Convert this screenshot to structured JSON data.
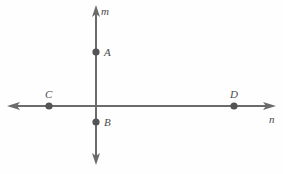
{
  "figure": {
    "background_color": "#fefefe",
    "line_color": "#6b6b6b",
    "point_color": "#545454",
    "label_color": "#4a4a4a",
    "lines": [
      {
        "name": "m",
        "label": "m",
        "orientation": "vertical",
        "label_x": 101,
        "label_y": 15,
        "x1": 96,
        "y1": 6,
        "x2": 96,
        "y2": 165,
        "arrow_start": true,
        "arrow_end": true
      },
      {
        "name": "n",
        "label": "n",
        "orientation": "horizontal",
        "label_x": 269,
        "label_y": 123,
        "x1": 8,
        "y1": 106,
        "x2": 275,
        "y2": 106,
        "arrow_start": true,
        "arrow_end": true
      }
    ],
    "points": [
      {
        "name": "A",
        "label": "A",
        "x": 96,
        "y": 52,
        "label_x": 104,
        "label_y": 56,
        "on_line": "m"
      },
      {
        "name": "B",
        "label": "B",
        "x": 96,
        "y": 122,
        "label_x": 104,
        "label_y": 126,
        "on_line": "m"
      },
      {
        "name": "C",
        "label": "C",
        "x": 49,
        "y": 106,
        "label_x": 45,
        "label_y": 98,
        "on_line": "n"
      },
      {
        "name": "D",
        "label": "D",
        "x": 234,
        "y": 106,
        "label_x": 230,
        "label_y": 98,
        "on_line": "n"
      }
    ]
  }
}
